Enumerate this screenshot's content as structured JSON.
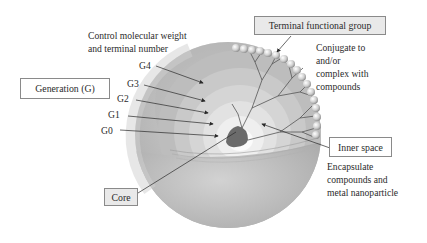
{
  "diagram": {
    "labels": {
      "control_line1": "Control molecular weight",
      "control_line2": "and terminal number",
      "terminal_group": "Terminal functional group",
      "conjugate_line1": "Conjugate to",
      "conjugate_line2": "and/or",
      "conjugate_line3": "complex with",
      "conjugate_line4": "compounds",
      "generation": "Generation (G)",
      "inner_space": "Inner space",
      "encapsulate_line1": "Encapsulate",
      "encapsulate_line2": "compounds and",
      "encapsulate_line3": "metal nanoparticle",
      "core": "Core"
    },
    "generations": [
      "G4",
      "G3",
      "G2",
      "G1",
      "G0"
    ],
    "colors": {
      "sphere_outer": "#b9b9b9",
      "sphere_shell": "#c8c8c8",
      "layer_g4": "#b4b4b4",
      "layer_g3": "#c6c6c6",
      "layer_g2": "#d6d6d6",
      "layer_g1": "#e6e6e6",
      "layer_g0": "#f4f4f4",
      "core": "#6e6e6e",
      "bead": "#d9d9d9",
      "box_grey": "#e9e9e9",
      "line": "#3a3a3a"
    }
  }
}
